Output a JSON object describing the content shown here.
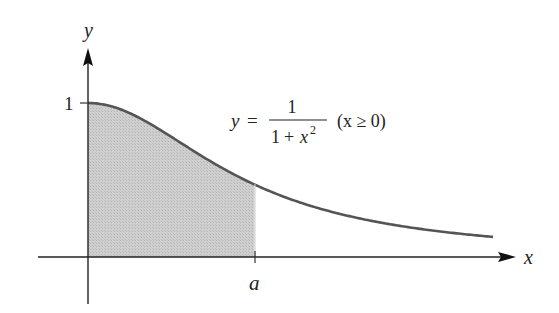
{
  "figure": {
    "type": "area-under-curve",
    "axes": {
      "x_label": "x",
      "y_label": "y",
      "y_tick_label": "1",
      "x_marker_label": "a"
    },
    "equation": {
      "lhs": "y",
      "equals": "=",
      "numerator": "1",
      "denominator_base": "1 + x",
      "denominator_exp": "2",
      "condition": "(x ≥ 0)"
    },
    "colors": {
      "curve": "#555555",
      "shade": "#c8c8c8",
      "axis": "#222222"
    }
  },
  "chart_data": {
    "type": "area",
    "title": "",
    "function": "y = 1/(1+x^2), x >= 0",
    "xlabel": "x",
    "ylabel": "y",
    "y_ticks": [
      "1"
    ],
    "x_ticks": [
      "a"
    ],
    "shaded_region": {
      "from": 0,
      "to": "a",
      "approx_a": 1.06
    },
    "x": [
      0,
      0.25,
      0.5,
      0.75,
      1.0,
      1.25,
      1.5,
      2.0,
      2.58
    ],
    "values": [
      1.0,
      0.94,
      0.8,
      0.64,
      0.5,
      0.39,
      0.31,
      0.2,
      0.13
    ],
    "grid": false,
    "legend": null
  }
}
